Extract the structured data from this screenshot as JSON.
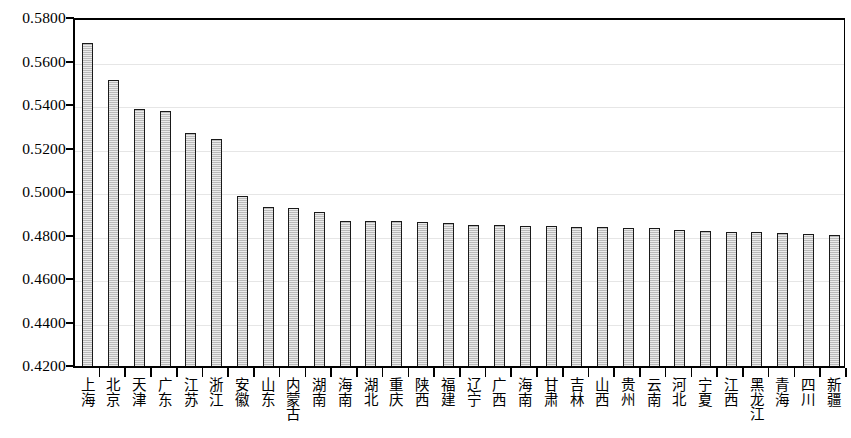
{
  "chart_data": {
    "type": "bar",
    "title": "",
    "subtitle": "",
    "xlabel": "",
    "ylabel": "",
    "ylim": [
      0.42,
      0.58
    ],
    "ytick_labels": [
      "0.5800",
      "0.5600",
      "0.5400",
      "0.5200",
      "0.5000",
      "0.4800",
      "0.4600",
      "0.4400",
      "0.4200"
    ],
    "ytick_values": [
      0.58,
      0.56,
      0.54,
      0.52,
      0.5,
      0.48,
      0.46,
      0.44,
      0.42
    ],
    "grid": true,
    "grid_axis": "y",
    "legend": false,
    "legend_position": "none",
    "bar_fill_color": "#d2d2d2",
    "bar_edge_color": "#1a1a1a",
    "gridline_color": "#e6e6e6",
    "axis_color": "#000000",
    "background_color": "#ffffff",
    "categories": [
      "上海",
      "北京",
      "天津",
      "广东",
      "江苏",
      "浙江",
      "安徽",
      "山东",
      "内蒙古",
      "湖南",
      "海南",
      "湖北",
      "重庆",
      "陕西",
      "福建",
      "辽宁",
      "广西",
      "海南",
      "甘肃",
      "吉林",
      "山西",
      "贵州",
      "云南",
      "河北",
      "宁夏",
      "江西",
      "黑龙江",
      "青海",
      "四川",
      "新疆"
    ],
    "values": [
      0.569,
      0.552,
      0.5385,
      0.5375,
      0.5275,
      0.525,
      0.4985,
      0.4935,
      0.493,
      0.4915,
      0.487,
      0.487,
      0.487,
      0.4865,
      0.486,
      0.4855,
      0.4855,
      0.485,
      0.485,
      0.4845,
      0.4845,
      0.484,
      0.484,
      0.483,
      0.4825,
      0.482,
      0.482,
      0.4815,
      0.481,
      0.4805
    ]
  }
}
